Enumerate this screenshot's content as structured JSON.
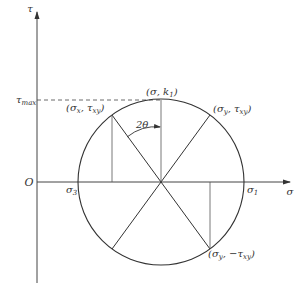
{
  "diagram": {
    "type": "mohr-circle",
    "axes": {
      "vertical_label": "τ",
      "horizontal_label": "σ",
      "origin_label": "O"
    },
    "labels": {
      "tau_max": "τ",
      "tau_max_sub": "max",
      "top_point": "(σ, k",
      "top_point_sub": "1",
      "top_point_close": ")",
      "angle": "2θ",
      "sigma3": "σ",
      "sigma3_sub": "3",
      "sigma1": "σ",
      "sigma1_sub": "1",
      "point_x": "(σ",
      "point_x_sub1": "x",
      "point_x_mid": ", τ",
      "point_x_sub2": "xy",
      "point_x_close": ")",
      "point_y": "(σ",
      "point_y_sub1": "y",
      "point_y_mid": ", τ",
      "point_y_sub2": "xy",
      "point_y_close": ")",
      "point_y_neg": "(σ",
      "point_y_neg_sub1": "y",
      "point_y_neg_mid": ", −τ",
      "point_y_neg_sub2": "xy",
      "point_y_neg_close": ")"
    },
    "colors": {
      "line": "#333333",
      "thin": "#555555"
    }
  }
}
